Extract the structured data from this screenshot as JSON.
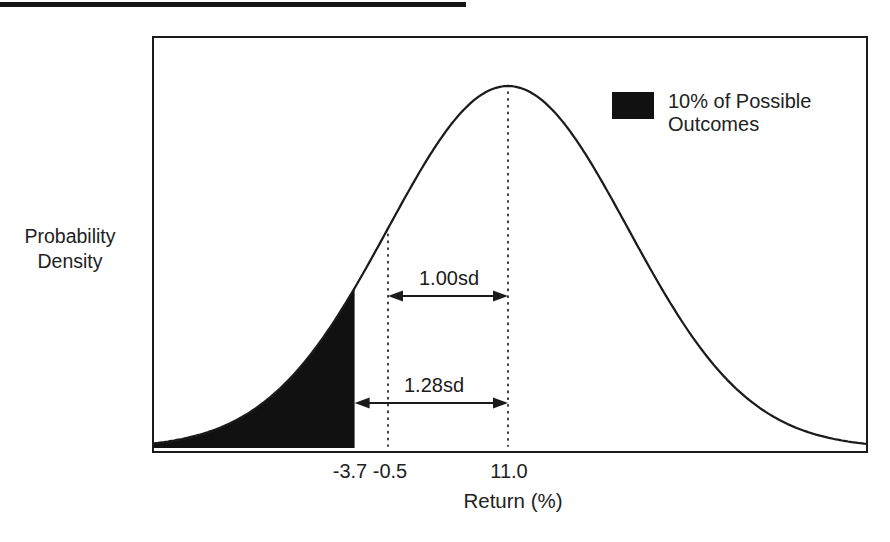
{
  "page": {
    "ink_color": "#1b1b1b",
    "background_color": "#ffffff"
  },
  "chart_data": {
    "type": "line",
    "subtype": "normal-density-curve",
    "title": "",
    "xlabel": "Return (%)",
    "ylabel_lines": [
      "Probability",
      "Density"
    ],
    "distribution": "normal",
    "mean": 11.0,
    "sd": 11.5,
    "x_range_approx": [
      -23,
      45
    ],
    "x_tick_values": [
      -3.7,
      -0.5,
      11.0
    ],
    "x_tick_labels": [
      "-3.7",
      "-0.5",
      "11.0"
    ],
    "y_ticks": [],
    "grid": false,
    "dotted_lines": [
      -0.5,
      11.0
    ],
    "shaded_region": {
      "below": -3.7,
      "probability_pct": 10,
      "color": "#111111"
    },
    "annotations": [
      {
        "label": "1.00sd",
        "from": -0.5,
        "to": 11.0
      },
      {
        "label": "1.28sd",
        "from": -3.7,
        "to": 11.0
      }
    ],
    "legend": {
      "position": "upper-right-inside",
      "swatch_color": "#111111",
      "label_line1": "10% of Possible",
      "label_line2": "Outcomes"
    }
  }
}
